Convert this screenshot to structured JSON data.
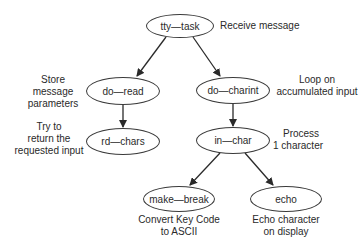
{
  "diagram": {
    "type": "call-tree",
    "nodes": [
      {
        "id": "tty_task",
        "label": "tty_task",
        "note": "Receive message"
      },
      {
        "id": "do_read",
        "label": "do_read",
        "note": "Store message parameters"
      },
      {
        "id": "do_charint",
        "label": "do_charint",
        "note": "Loop on accumulated input"
      },
      {
        "id": "rd_chars",
        "label": "rd_chars",
        "note": "Try to return the requested input"
      },
      {
        "id": "in_char",
        "label": "in_char",
        "note": "Process 1 character"
      },
      {
        "id": "make_break",
        "label": "make_break",
        "note": "Convert Key Code to ASCII"
      },
      {
        "id": "echo",
        "label": "echo",
        "note": "Echo character on display"
      }
    ],
    "edges": [
      {
        "from": "tty_task",
        "to": "do_read"
      },
      {
        "from": "tty_task",
        "to": "do_charint"
      },
      {
        "from": "do_read",
        "to": "rd_chars"
      },
      {
        "from": "do_charint",
        "to": "in_char"
      },
      {
        "from": "in_char",
        "to": "make_break"
      },
      {
        "from": "in_char",
        "to": "echo"
      }
    ]
  },
  "labels": {
    "tty_task": "tty—task",
    "do_read": "do—read",
    "do_charint": "do—charint",
    "rd_chars": "rd—chars",
    "in_char": "in—char",
    "make_break": "make—break",
    "echo": "echo"
  },
  "notes": {
    "tty_task": [
      "Receive message"
    ],
    "do_read": [
      "Store message",
      "parameters"
    ],
    "do_charint": [
      "Loop on",
      "accumulated input"
    ],
    "rd_chars": [
      "Try to",
      "return the",
      "requested input"
    ],
    "in_char": [
      "Process",
      "1 character"
    ],
    "make_break": [
      "Convert Key Code",
      "to ASCII"
    ],
    "echo": [
      "Echo character",
      "on display"
    ]
  }
}
